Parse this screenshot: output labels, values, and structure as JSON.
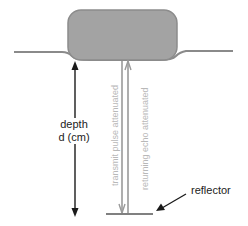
{
  "diagram": {
    "type": "ultrasound-depth-measurement",
    "depth_label_line1": "depth",
    "depth_label_line2": "d (cm)",
    "transmit_label": "transmit pulse attenuated",
    "echo_label": "returning echo attenuated",
    "reflector_label": "reflector",
    "colors": {
      "transducer_fill": "#a3a3a3",
      "transducer_stroke": "#8c8c8c",
      "surface_line": "#8a8a8a",
      "beam_lines": "#9a9a9a",
      "arrow": "#1a1a1a",
      "reflector_bar": "#808080",
      "vertical_text": "#b8b8b8"
    },
    "icons": {
      "transducer": "transducer-block-icon",
      "depth_arrow": "double-arrow-vertical-icon",
      "pointer_arrow": "arrow-pointer-icon"
    }
  }
}
